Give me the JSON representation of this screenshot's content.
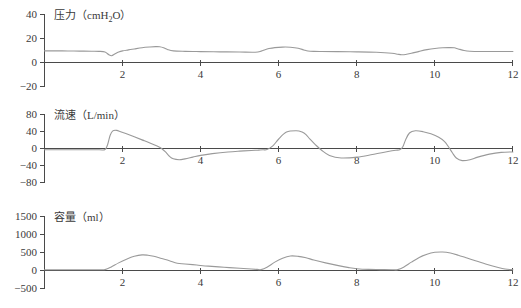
{
  "figure": {
    "background_color": "#ffffff",
    "trace_color": "#9a9a9a",
    "axis_color": "#4a4a4a",
    "text_color": "#3a3a3a"
  },
  "chart_data": [
    {
      "type": "line",
      "panel": "pressure",
      "title": "",
      "label_main": "压力",
      "label_unit_prefix": "（cmH",
      "label_unit_sub": "2",
      "label_unit_suffix": "O）",
      "label_full": "压力（cmH2O）",
      "ylabel": "压力（cmH2O）",
      "xlabel": "",
      "ylim": [
        -20,
        40
      ],
      "xlim": [
        0,
        12
      ],
      "yticks": [
        40,
        20,
        0,
        -20
      ],
      "ytick_labels": [
        "40",
        "20",
        "0",
        "−20"
      ],
      "xticks": [
        2,
        4,
        6,
        8,
        10,
        12
      ],
      "xtick_labels": [
        "2",
        "4",
        "6",
        "8",
        "10",
        "12"
      ],
      "grid": false,
      "legend": "none",
      "x": [
        0.0,
        0.3,
        0.6,
        0.9,
        1.2,
        1.4,
        1.55,
        1.65,
        1.72,
        1.8,
        1.9,
        2.0,
        2.15,
        2.3,
        2.5,
        2.7,
        2.85,
        2.95,
        3.05,
        3.15,
        3.3,
        3.6,
        4.0,
        4.5,
        5.0,
        5.4,
        5.55,
        5.65,
        5.75,
        5.9,
        6.1,
        6.3,
        6.5,
        6.65,
        6.75,
        6.9,
        7.1,
        7.5,
        8.0,
        8.5,
        8.9,
        9.05,
        9.15,
        9.25,
        9.4,
        9.6,
        9.8,
        10.0,
        10.2,
        10.4,
        10.5,
        10.6,
        10.75,
        10.9,
        11.2,
        11.6,
        12.0
      ],
      "y": [
        9.6,
        9.6,
        9.5,
        9.4,
        9.3,
        9.2,
        8.6,
        6.4,
        5.6,
        7.0,
        8.6,
        9.6,
        10.4,
        11.2,
        12.2,
        12.8,
        13.1,
        13.0,
        12.2,
        10.8,
        9.6,
        9.2,
        9.0,
        8.8,
        8.6,
        8.5,
        9.4,
        10.6,
        11.5,
        12.3,
        12.7,
        12.6,
        11.8,
        10.3,
        9.5,
        9.2,
        9.1,
        9.0,
        8.8,
        8.4,
        7.6,
        6.8,
        6.4,
        6.6,
        7.6,
        9.2,
        10.6,
        11.6,
        12.2,
        12.3,
        12.1,
        11.2,
        9.9,
        9.3,
        9.1,
        9.1,
        9.1
      ]
    },
    {
      "type": "line",
      "panel": "flow",
      "title": "",
      "label_main": "流速",
      "label_unit": "（L/min）",
      "label_full": "流速（L/min）",
      "ylabel": "流速（L/min）",
      "xlabel": "",
      "ylim": [
        -80,
        80
      ],
      "xlim": [
        0,
        12
      ],
      "yticks": [
        80,
        40,
        0,
        -40,
        -80
      ],
      "ytick_labels": [
        "80",
        "40",
        "0",
        "−40",
        "−80"
      ],
      "xticks": [
        2,
        4,
        6,
        8,
        10,
        12
      ],
      "xtick_labels": [
        "2",
        "4",
        "6",
        "8",
        "10",
        "12"
      ],
      "grid": false,
      "legend": "none",
      "x": [
        0.0,
        0.5,
        1.0,
        1.4,
        1.55,
        1.62,
        1.68,
        1.75,
        1.85,
        1.95,
        2.1,
        2.3,
        2.5,
        2.7,
        2.9,
        3.0,
        3.1,
        3.2,
        3.3,
        3.45,
        3.6,
        3.8,
        4.0,
        4.3,
        4.7,
        5.0,
        5.3,
        5.45,
        5.52,
        5.6,
        5.7,
        5.85,
        6.0,
        6.2,
        6.45,
        6.6,
        6.7,
        6.8,
        6.95,
        7.1,
        7.3,
        7.6,
        8.0,
        8.4,
        8.8,
        9.0,
        9.1,
        9.18,
        9.25,
        9.35,
        9.5,
        9.7,
        9.9,
        10.1,
        10.25,
        10.35,
        10.45,
        10.55,
        10.7,
        10.9,
        11.1,
        11.4,
        11.7,
        12.0
      ],
      "y": [
        -3.0,
        -3.0,
        -3.0,
        -3.0,
        -2.5,
        10.0,
        30.0,
        41.0,
        42.0,
        39.0,
        34.0,
        27.0,
        20.0,
        13.0,
        5.0,
        0.0,
        -8.0,
        -18.0,
        -24.0,
        -26.0,
        -24.0,
        -20.0,
        -16.0,
        -12.0,
        -8.0,
        -6.0,
        -4.5,
        -4.0,
        -3.5,
        -3.0,
        -2.5,
        6.0,
        22.0,
        38.0,
        41.0,
        38.0,
        32.0,
        22.0,
        8.0,
        -4.0,
        -16.0,
        -22.0,
        -20.0,
        -14.0,
        -7.0,
        -4.0,
        -3.0,
        4.0,
        20.0,
        36.0,
        41.0,
        39.0,
        34.0,
        26.0,
        16.0,
        4.0,
        -10.0,
        -22.0,
        -28.0,
        -26.0,
        -20.0,
        -13.0,
        -9.0,
        -8.0
      ]
    },
    {
      "type": "line",
      "panel": "volume",
      "title": "",
      "label_main": "容量",
      "label_unit": "（ml）",
      "label_full": "容量（ml）",
      "ylabel": "容量（ml）",
      "xlabel": "",
      "ylim": [
        -500,
        1500
      ],
      "xlim": [
        0,
        12
      ],
      "yticks": [
        1500,
        1000,
        500,
        0,
        -500
      ],
      "ytick_labels": [
        "1500",
        "1000",
        "500",
        "0",
        "−500"
      ],
      "xticks": [
        2,
        4,
        6,
        8,
        10,
        12
      ],
      "xtick_labels": [
        "2",
        "4",
        "6",
        "8",
        "10",
        "12"
      ],
      "grid": false,
      "legend": "none",
      "x": [
        0.0,
        0.5,
        1.0,
        1.4,
        1.55,
        1.7,
        1.9,
        2.1,
        2.3,
        2.5,
        2.65,
        2.8,
        3.0,
        3.2,
        3.4,
        3.6,
        3.9,
        4.2,
        4.6,
        5.0,
        5.3,
        5.45,
        5.55,
        5.7,
        5.9,
        6.1,
        6.3,
        6.5,
        6.7,
        6.9,
        7.2,
        7.5,
        7.8,
        8.0,
        8.3,
        8.6,
        8.9,
        9.05,
        9.2,
        9.4,
        9.6,
        9.8,
        10.0,
        10.2,
        10.4,
        10.6,
        10.8,
        11.0,
        11.3,
        11.6,
        11.8,
        12.0
      ],
      "y": [
        20.0,
        20.0,
        20.0,
        20.0,
        25.0,
        90.0,
        210.0,
        310.0,
        390.0,
        430.0,
        420.0,
        390.0,
        330.0,
        270.0,
        200.0,
        180.0,
        150.0,
        120.0,
        90.0,
        60.0,
        40.0,
        30.0,
        25.0,
        90.0,
        230.0,
        340.0,
        400.0,
        390.0,
        350.0,
        290.0,
        210.0,
        140.0,
        80.0,
        50.0,
        30.0,
        25.0,
        20.0,
        25.0,
        90.0,
        230.0,
        360.0,
        450.0,
        500.0,
        510.0,
        480.0,
        420.0,
        350.0,
        280.0,
        180.0,
        90.0,
        40.0,
        20.0
      ]
    }
  ]
}
